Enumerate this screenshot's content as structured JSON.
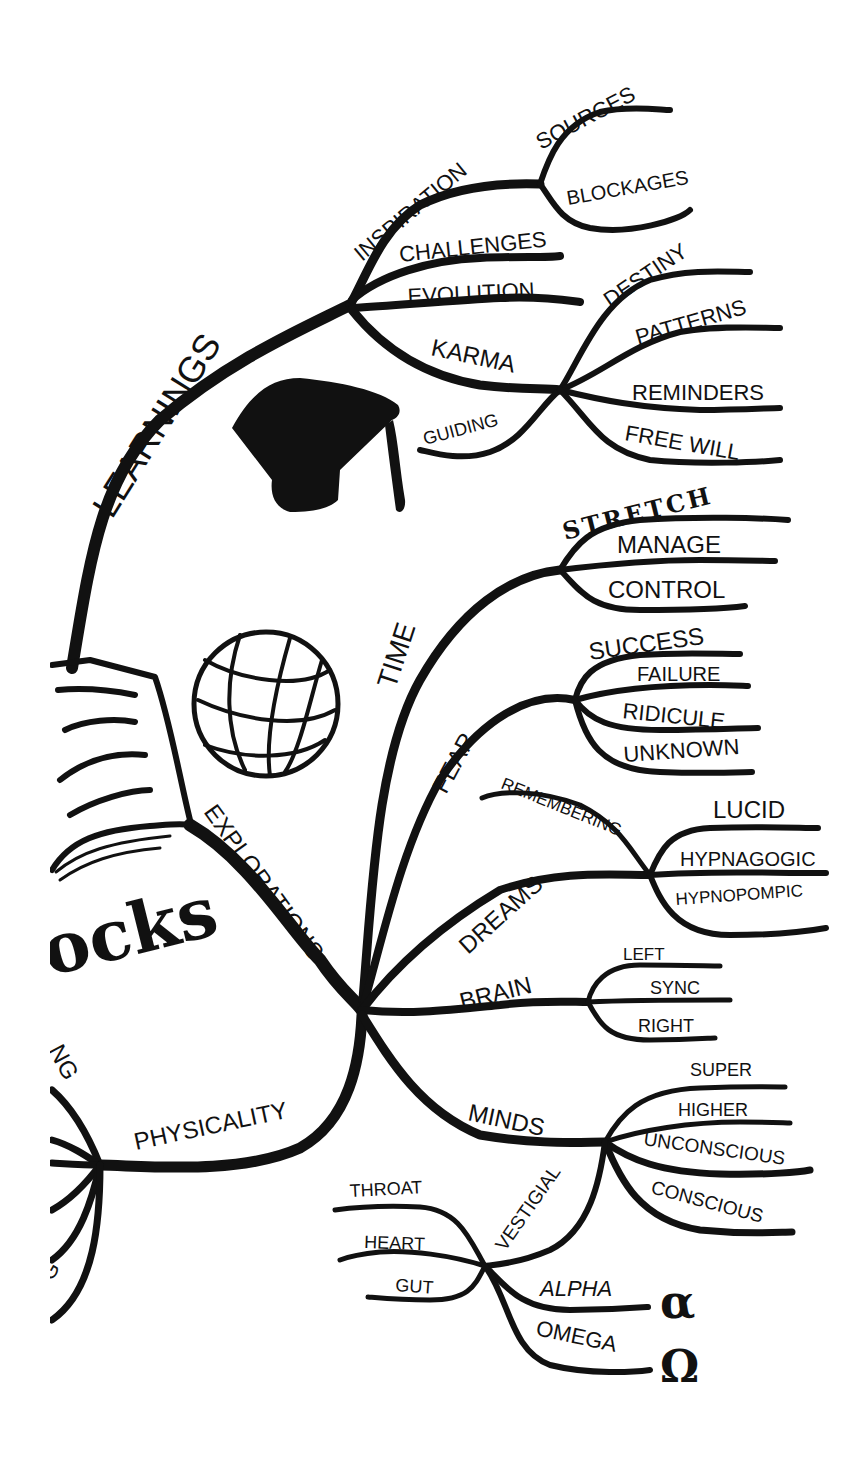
{
  "mindmap": {
    "center_fragment": "ocks",
    "branches": {
      "learnings": {
        "label": "LEARNINGS",
        "children": {
          "inspiration": {
            "label": "INSPIRATION",
            "children": [
              "SOURCES",
              "BLOCKAGES"
            ]
          },
          "challenges": {
            "label": "CHALLENGES"
          },
          "evolution": {
            "label": "EVOLUTION"
          },
          "karma": {
            "label": "KARMA",
            "guiding": "GUIDING",
            "children": [
              "DESTINY",
              "PATTERNS",
              "REMINDERS",
              "FREE WILL"
            ]
          }
        }
      },
      "explorations": {
        "label": "EXPLORATIONS",
        "children": {
          "time": {
            "label": "TIME",
            "children": [
              "STRETCH",
              "MANAGE",
              "CONTROL"
            ]
          },
          "fear": {
            "label": "FEAR",
            "children": [
              "SUCCESS",
              "FAILURE",
              "RIDICULE",
              "UNKNOWN"
            ]
          },
          "dreams": {
            "label": "DREAMS",
            "remembering": "REMEMBERING",
            "children": [
              "LUCID",
              "HYPNAGOGIC",
              "HYPNOPOMPIC"
            ]
          },
          "brain": {
            "label": "BRAIN",
            "children": [
              "LEFT",
              "SYNC",
              "RIGHT"
            ]
          },
          "minds": {
            "label": "MINDS",
            "children": [
              "SUPER",
              "HIGHER",
              "UNCONSCIOUS",
              "CONSCIOUS"
            ],
            "vestigial": {
              "label": "VESTIGIAL",
              "left_children": [
                "THROAT",
                "HEART",
                "GUT"
              ],
              "right_children": [
                "ALPHA",
                "OMEGA"
              ]
            }
          }
        }
      },
      "physicality": {
        "label": "PHYSICALITY",
        "partial_labels": [
          "NG",
          "G"
        ]
      }
    },
    "symbols": {
      "alpha": "α",
      "omega": "Ω"
    },
    "icons": [
      "graduation-cap-icon",
      "globe-icon",
      "open-book-icon"
    ]
  }
}
